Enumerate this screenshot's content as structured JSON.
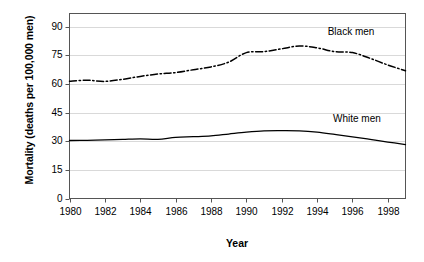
{
  "chart_data": {
    "type": "line",
    "title": "",
    "xlabel": "Year",
    "ylabel": "Mortality (deaths per 100,000 men)",
    "xlim": [
      1980,
      1999
    ],
    "ylim": [
      0,
      97
    ],
    "yticks": [
      0,
      15,
      30,
      45,
      60,
      75,
      90
    ],
    "ytick_labels": [
      "0",
      "15",
      "30",
      "45",
      "60",
      "75",
      "90"
    ],
    "xticks": [
      1980,
      1982,
      1984,
      1986,
      1988,
      1990,
      1992,
      1994,
      1996,
      1998
    ],
    "xtick_labels": [
      "1980",
      "1982",
      "1984",
      "1986",
      "1988",
      "1990",
      "1992",
      "1994",
      "1996",
      "1998"
    ],
    "grid": true,
    "grid_color": "#cfcfcf",
    "legend_position": "inline-right",
    "x": [
      1980,
      1981,
      1982,
      1983,
      1984,
      1985,
      1986,
      1987,
      1988,
      1989,
      1990,
      1991,
      1992,
      1993,
      1994,
      1995,
      1996,
      1997,
      1998,
      1999
    ],
    "series": [
      {
        "name": "Black men",
        "line_style": "dash-dot",
        "color": "#000000",
        "label_x": 1994.6,
        "label_y": 87.5,
        "values": [
          61.5,
          62.0,
          61.4,
          62.5,
          64.0,
          65.3,
          66.0,
          67.5,
          69.0,
          71.5,
          76.5,
          77.0,
          78.5,
          80.0,
          79.0,
          77.0,
          76.5,
          73.5,
          70.0,
          67.0
        ]
      },
      {
        "name": "White men",
        "line_style": "solid",
        "color": "#000000",
        "label_x": 1994.9,
        "label_y": 41.5,
        "values": [
          30.4,
          30.5,
          30.7,
          31.0,
          31.3,
          31.0,
          32.1,
          32.4,
          32.8,
          33.8,
          34.8,
          35.5,
          35.6,
          35.5,
          34.8,
          33.6,
          32.3,
          31.0,
          29.6,
          28.3
        ]
      }
    ]
  }
}
